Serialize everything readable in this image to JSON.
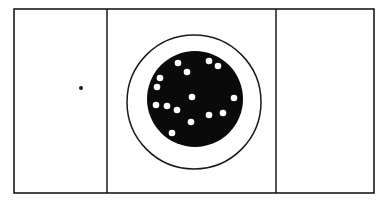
{
  "diagram": {
    "colors": {
      "background": "#ffffff",
      "line": "#1a1a1a",
      "disk": "#0a0a0a",
      "dots": "#ffffff"
    },
    "frame": {
      "x": 14,
      "y": 9,
      "width": 360,
      "height": 184
    },
    "dividers": [
      107,
      276
    ],
    "ring": {
      "cx": 194,
      "cy": 102,
      "r": 67
    },
    "disk": {
      "cx": 195,
      "cy": 99,
      "r": 48
    },
    "left_dot": {
      "cx": 81,
      "cy": 88,
      "r": 2
    },
    "white_dots": [
      [
        178,
        63
      ],
      [
        209,
        61
      ],
      [
        218,
        66
      ],
      [
        187,
        72
      ],
      [
        160,
        78
      ],
      [
        157,
        87
      ],
      [
        192,
        97
      ],
      [
        234,
        98
      ],
      [
        156,
        105
      ],
      [
        167,
        106
      ],
      [
        177,
        110
      ],
      [
        209,
        115
      ],
      [
        223,
        113
      ],
      [
        191,
        122
      ],
      [
        172,
        133
      ]
    ]
  }
}
